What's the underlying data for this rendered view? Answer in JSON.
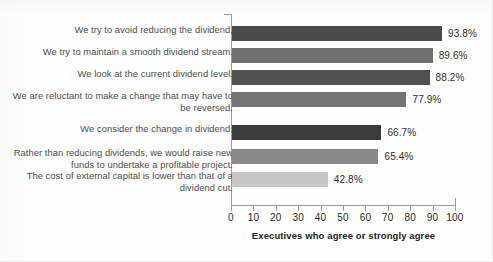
{
  "chart_data": {
    "type": "bar",
    "orientation": "horizontal",
    "title": "",
    "xlabel": "Executives who agree or strongly agree",
    "ylabel": "",
    "xlim": [
      0,
      100
    ],
    "xticks": [
      0,
      10,
      20,
      30,
      40,
      50,
      60,
      70,
      80,
      90,
      100
    ],
    "grid": false,
    "legend": null,
    "categories": [
      "We try to avoid reducing the dividend.",
      "We try to maintain a smooth dividend stream.",
      "We look at the current dividend level.",
      "We are reluctant to make a change that may have to be reversed.",
      "We consider the change in dividend.",
      "Rather than reducing dividends, we would raise new funds to undertake a profitable project.",
      "The cost of external capital is lower than that of a dividend cut."
    ],
    "values": [
      93.8,
      89.6,
      88.2,
      77.9,
      66.7,
      65.4,
      42.8
    ],
    "value_labels": [
      "93.8%",
      "89.6%",
      "88.2%",
      "77.9%",
      "66.7%",
      "65.4%",
      "42.8%"
    ],
    "bar_colors": [
      "#4a4a4a",
      "#6f6f6f",
      "#515151",
      "#757575",
      "#3c3c3c",
      "#8a8a8a",
      "#c6c6c6"
    ]
  },
  "axis": {
    "tick_labels": [
      "0",
      "10",
      "20",
      "30",
      "40",
      "50",
      "60",
      "70",
      "80",
      "90",
      "100"
    ],
    "title": "Executives who agree or strongly agree"
  },
  "rows": [
    {
      "label": "We try to avoid reducing the dividend.",
      "value_label": "93.8%"
    },
    {
      "label": "We try to maintain a smooth dividend stream.",
      "value_label": "89.6%"
    },
    {
      "label": "We look at the current dividend level.",
      "value_label": "88.2%"
    },
    {
      "label": "We are reluctant to make a change that may have to be reversed.",
      "value_label": "77.9%"
    },
    {
      "label": "We consider the change in dividend.",
      "value_label": "66.7%"
    },
    {
      "label": "Rather than reducing dividends, we would raise new funds to undertake a profitable project.",
      "value_label": "65.4%"
    },
    {
      "label": "The cost of external capital is lower than that of a dividend cut.",
      "value_label": "42.8%"
    }
  ]
}
